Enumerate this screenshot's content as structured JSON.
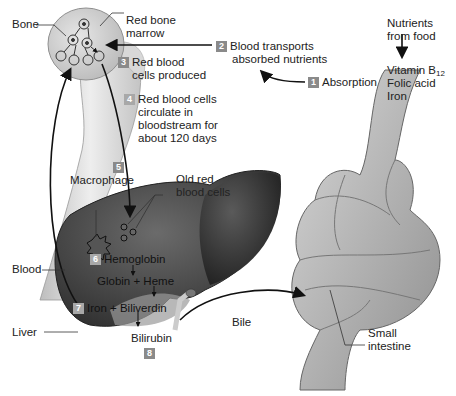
{
  "diagram": {
    "labels": {
      "bone": "Bone",
      "red_bone_marrow_1": "Red bone",
      "red_bone_marrow_2": "marrow",
      "nutrients_1": "Nutrients",
      "nutrients_2": "from food",
      "vitamin_b": "Vitamin B",
      "vitamin_sub": "12",
      "folic_acid": "Folic acid",
      "iron": "Iron",
      "macrophage": "Macrophage",
      "old_rbc_1": "Old red",
      "old_rbc_2": "blood cells",
      "blood": "Blood",
      "liver": "Liver",
      "bile": "Bile",
      "small_intestine_1": "Small",
      "small_intestine_2": "intestine"
    },
    "steps": [
      {
        "num": "1",
        "text": [
          "Absorption"
        ]
      },
      {
        "num": "2",
        "text": [
          "Blood transports",
          "absorbed nutrients"
        ]
      },
      {
        "num": "3",
        "text": [
          "Red blood",
          "cells produced"
        ]
      },
      {
        "num": "4",
        "text": [
          "Red blood cells",
          "circulate in",
          "bloodstream for",
          "about 120 days"
        ]
      },
      {
        "num": "5",
        "text": [
          "Macrophage"
        ]
      },
      {
        "num": "6",
        "text": [
          "Hemoglobin"
        ]
      },
      {
        "num": "6b",
        "text": [
          "Globin + Heme"
        ]
      },
      {
        "num": "7",
        "text": [
          "Iron + Biliverdin"
        ]
      },
      {
        "num": "8",
        "text": [
          "Bilirubin"
        ]
      }
    ],
    "colors": {
      "badge": "#8a8a8a",
      "liver": "#4a4a4a",
      "bone": "#cfcfcf",
      "intestine": "#b5b5b5",
      "arrow": "#111111"
    }
  }
}
